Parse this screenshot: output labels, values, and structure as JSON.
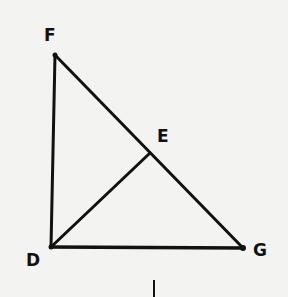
{
  "diagram": {
    "type": "geometry",
    "points": {
      "F": {
        "label": "F",
        "x": 55,
        "y": 55,
        "label_x": 44,
        "label_y": 41
      },
      "D": {
        "label": "D",
        "x": 51,
        "y": 247,
        "label_x": 26,
        "label_y": 266
      },
      "G": {
        "label": "G",
        "x": 243,
        "y": 248,
        "label_x": 253,
        "label_y": 256
      },
      "E": {
        "label": "E",
        "x": 150,
        "y": 153,
        "label_x": 157,
        "label_y": 142
      }
    },
    "segments": [
      {
        "from": "F",
        "to": "D"
      },
      {
        "from": "D",
        "to": "G"
      },
      {
        "from": "F",
        "to": "G"
      },
      {
        "from": "D",
        "to": "E"
      }
    ],
    "stroke_color": "#111111",
    "background_color": "#f3f3f1"
  }
}
